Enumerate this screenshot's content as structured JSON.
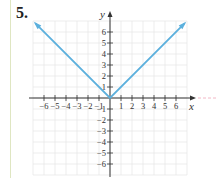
{
  "problem": {
    "number_label": "5."
  },
  "colors": {
    "curve": "#5cb0dd",
    "grid": "#e8e8e8",
    "axis": "#333333",
    "left_rule": "#dfe6c2",
    "extension_dash": "#f2b8c6"
  },
  "chart_data": {
    "type": "line",
    "title": "",
    "function": "y = |x|",
    "xlabel": "x",
    "ylabel": "y",
    "xlim": [
      -7,
      7
    ],
    "ylim": [
      -7,
      7
    ],
    "grid": true,
    "x_ticks": [
      -6,
      -5,
      -4,
      -3,
      -2,
      -1,
      1,
      2,
      3,
      4,
      5,
      6
    ],
    "y_ticks": [
      -6,
      -5,
      -4,
      -3,
      -2,
      -1,
      1,
      2,
      3,
      4,
      5,
      6
    ],
    "x_tick_labels": [
      "−6",
      "−5",
      "−4",
      "−3",
      "−2",
      "−1",
      "1",
      "2",
      "3",
      "4",
      "5",
      "6"
    ],
    "y_tick_labels": [
      "−6",
      "−5",
      "−4",
      "−3",
      "−2",
      "−1",
      "1",
      "2",
      "3",
      "4",
      "5",
      "6"
    ],
    "series": [
      {
        "name": "y = |x|",
        "x": [
          -6.8,
          0,
          6.8
        ],
        "y": [
          6.8,
          0,
          6.8
        ],
        "arrows_at_ends": true
      }
    ]
  }
}
